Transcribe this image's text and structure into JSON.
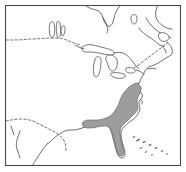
{
  "figure": {
    "kind": "range-map",
    "title": "Distribution map of eastern North America",
    "width": 186,
    "height": 172,
    "background_color": "#ffffff",
    "frame_color": "#4a4a4a",
    "coastline_color": "#3c3c3c",
    "range_fill_color": "#9d9d9d",
    "range_outline_color": "#5a5a5a",
    "dashed_border_color": "#4a4a4a"
  },
  "legend": {
    "shaded_meaning": "shaded area = species range",
    "visible_labels": []
  },
  "features": {
    "water_bodies": [
      "hudson-bay-james-bay",
      "lake-winnipeg",
      "lake-manitoba",
      "lake-superior",
      "lake-michigan",
      "lake-huron",
      "lake-erie",
      "lake-ontario",
      "gulf-of-st-lawrence",
      "gulf-of-mexico",
      "atlantic-ocean"
    ],
    "dashed_borders": [
      "canada-united-states-border",
      "united-states-mexico-border"
    ],
    "island_groups": [
      "bahamas"
    ]
  },
  "range": {
    "name": "atlantic-coastal-plain-range",
    "northern_limit": "chesapeake-bay",
    "southern_limit": "southern-florida",
    "western_limit": "gulf-coast-mississippi-alabama",
    "fill": "#9d9d9d"
  }
}
